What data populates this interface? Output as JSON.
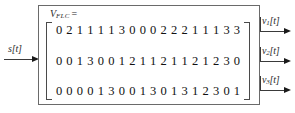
{
  "figure": {
    "block_border_color": "#6a6a6a",
    "text_color": "#111111"
  },
  "input": {
    "label": "s[t]",
    "arrow": "arrow-right"
  },
  "matrix": {
    "name": "V",
    "subscript": "FLC",
    "equals": "=",
    "rows": 3,
    "columns": 18,
    "values": [
      [
        "0",
        "2",
        "1",
        "1",
        "1",
        "1",
        "3",
        "0",
        "0",
        "0",
        "2",
        "2",
        "2",
        "1",
        "1",
        "1",
        "3",
        "3"
      ],
      [
        "0",
        "0",
        "1",
        "3",
        "0",
        "0",
        "1",
        "2",
        "1",
        "1",
        "2",
        "1",
        "1",
        "2",
        "1",
        "2",
        "3",
        "0"
      ],
      [
        "0",
        "0",
        "0",
        "0",
        "1",
        "3",
        "0",
        "0",
        "1",
        "3",
        "0",
        "1",
        "3",
        "1",
        "2",
        "3",
        "0",
        "1"
      ]
    ]
  },
  "outputs": [
    {
      "name": "v",
      "subscript": "1",
      "bracket": "[t]",
      "label": "v1[t]"
    },
    {
      "name": "v",
      "subscript": "2",
      "bracket": "[t]",
      "label": "v2[t]"
    },
    {
      "name": "v",
      "subscript": "3",
      "bracket": "[t]",
      "label": "v3[t]"
    }
  ]
}
